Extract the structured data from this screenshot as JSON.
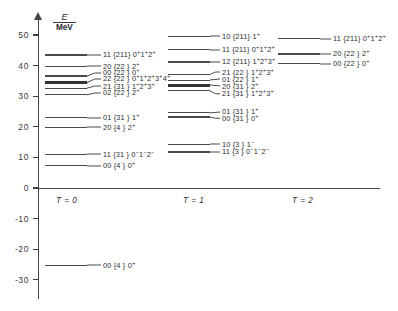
{
  "axis": {
    "unit_numerator": "E",
    "unit_denominator": "MeV",
    "y_ticks": [
      "50",
      "40",
      "30",
      "20",
      "10",
      "0",
      "-10",
      "-20",
      "-30"
    ],
    "y_values": [
      50,
      40,
      30,
      20,
      10,
      0,
      -10,
      -20,
      -30
    ],
    "ylim": [
      -32,
      54
    ]
  },
  "columns": [
    {
      "key": "t0",
      "header": "T = 0"
    },
    {
      "key": "t1",
      "header": "T = 1"
    },
    {
      "key": "t2",
      "header": "T = 2"
    }
  ],
  "chart_data": {
    "type": "line",
    "title": "",
    "subtitle": "",
    "xlabel": "",
    "ylabel": "E / MeV",
    "ylim": [
      -32,
      54
    ],
    "grid": false,
    "legend": "none",
    "categories": [
      "T = 0",
      "T = 1",
      "T = 2"
    ],
    "series": [
      {
        "name": "T = 0",
        "levels": [
          {
            "energy": 43.5,
            "label": "11 {211} 0⁺1⁺2⁺",
            "thick": false
          },
          {
            "energy": 39.8,
            "label": "20 {22 } 2⁺",
            "thick": false
          },
          {
            "energy": 36.6,
            "label": "00 {22 } 0⁺",
            "thick": false
          },
          {
            "energy": 34.4,
            "label": "22 {22 } 0⁺1⁺2⁺3⁺4⁺",
            "thick": true
          },
          {
            "energy": 32.6,
            "label": "21 {31 } 1⁺2⁺3⁺",
            "thick": false
          },
          {
            "energy": 30.5,
            "label": "02 {22 } 2⁺",
            "thick": false
          },
          {
            "energy": 23.0,
            "label": "01 {31 } 1⁺",
            "thick": false
          },
          {
            "energy": 19.8,
            "label": "20 {4 } 2⁺",
            "thick": false
          },
          {
            "energy": 11.0,
            "label": "11 {31 } 0⁻1⁻2⁻",
            "thick": false
          },
          {
            "energy": 7.3,
            "label": "00 {4 } 0⁺",
            "thick": false
          },
          {
            "energy": -25.3,
            "label": "00 {4 } 0⁺",
            "thick": false
          }
        ]
      },
      {
        "name": "T = 1",
        "levels": [
          {
            "energy": 49.6,
            "label": "10 {211} 1⁺",
            "thick": false
          },
          {
            "energy": 45.2,
            "label": "11 {211} 0⁺1⁺2⁺",
            "thick": false
          },
          {
            "energy": 41.2,
            "label": "12 {211} 1⁺2⁺3⁺",
            "thick": false
          },
          {
            "energy": 37.0,
            "label": "21 {22 } 1⁺2⁺3⁺",
            "thick": false
          },
          {
            "energy": 35.2,
            "label": "01 {22 } 1⁺",
            "thick": false
          },
          {
            "energy": 33.5,
            "label": "20 {31 } 2⁺",
            "thick": true
          },
          {
            "energy": 31.8,
            "label": "21 {31 } 1⁺2⁺3⁺",
            "thick": false
          },
          {
            "energy": 24.6,
            "label": "01 {31 } 1⁺",
            "thick": false
          },
          {
            "energy": 23.2,
            "label": "00 {31 } 0⁺",
            "thick": false
          },
          {
            "energy": 14.3,
            "label": "10 {3 } 1⁻",
            "thick": false
          },
          {
            "energy": 11.8,
            "label": "11 {3 } 0⁻1⁻2⁻",
            "thick": false
          }
        ]
      },
      {
        "name": "T = 2",
        "levels": [
          {
            "energy": 48.8,
            "label": "11 {211} 0⁺1⁺2⁺",
            "thick": false
          },
          {
            "energy": 43.8,
            "label": "20 {22 } 2⁺",
            "thick": false
          },
          {
            "energy": 40.6,
            "label": "00 {22 } 0⁺",
            "thick": false
          }
        ]
      }
    ]
  },
  "layout": {
    "columns_px": [
      {
        "key": "t0",
        "line_left": 45,
        "line_width": 42,
        "label_left": 103,
        "header_left": 56
      },
      {
        "key": "t1",
        "line_left": 168,
        "line_width": 42,
        "label_left": 222,
        "header_left": 183
      },
      {
        "key": "t2",
        "line_left": 278,
        "line_width": 42,
        "label_left": 333,
        "header_left": 292
      }
    ],
    "label_rows": {
      "t0": [
        43.5,
        39.8,
        37.6,
        35.6,
        33.3,
        31.1,
        23.0,
        19.8,
        11.0,
        7.3,
        -25.3
      ],
      "t1": [
        49.6,
        45.2,
        41.2,
        37.8,
        35.5,
        33.2,
        30.9,
        24.9,
        22.8,
        14.3,
        11.8
      ],
      "t2": [
        48.8,
        43.8,
        40.6
      ]
    }
  }
}
